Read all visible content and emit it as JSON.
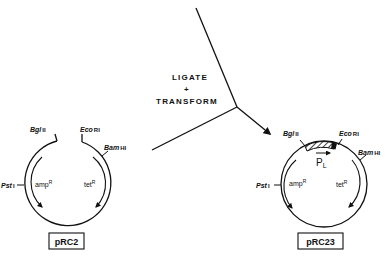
{
  "process": {
    "step_line1": "LIGATE",
    "step_line2": "+",
    "step_line3": "TRANSFORM"
  },
  "plasmid_left": {
    "name": "pRC2",
    "sites": {
      "bglII_italic": "Bgl",
      "bglII_roman": "II",
      "ecoRI_italic": "Eco",
      "ecoRI_roman": "RI",
      "bamHI_italic": "Bam",
      "bamHI_roman": "HI",
      "pstI_italic": "Pst",
      "pstI_roman": "I"
    },
    "genes": {
      "amp": "amp",
      "amp_sup": "R",
      "tet": "tet",
      "tet_sup": "R"
    }
  },
  "plasmid_right": {
    "name": "pRC23",
    "promoter": "P",
    "promoter_sub": "L",
    "sites": {
      "bglII_italic": "Bgl",
      "bglII_roman": "II",
      "ecoRI_italic": "Eco",
      "ecoRI_roman": "RI",
      "bamHI_italic": "Bam",
      "bamHI_roman": "HI",
      "pstI_italic": "Pst",
      "pstI_roman": "I"
    },
    "genes": {
      "amp": "amp",
      "amp_sup": "R",
      "tet": "tet",
      "tet_sup": "R"
    }
  }
}
